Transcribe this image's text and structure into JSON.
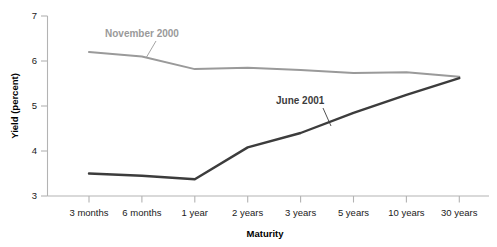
{
  "chart_data": {
    "type": "line",
    "title": "",
    "xlabel": "Maturity",
    "ylabel": "Yield (percent)",
    "categories": [
      "3 months",
      "6 months",
      "1 year",
      "2 years",
      "3 years",
      "5 years",
      "10 years",
      "30 years"
    ],
    "ylim": [
      3,
      7
    ],
    "yticks": [
      3,
      4,
      5,
      6,
      7
    ],
    "ytick_labels": [
      "3",
      "4",
      "5",
      "6",
      "7"
    ],
    "grid": false,
    "legend": "inline-annotations",
    "series": [
      {
        "name": "November 2000",
        "color": "#9a9a9a",
        "width": 2.0,
        "values": [
          6.2,
          6.1,
          5.82,
          5.85,
          5.8,
          5.73,
          5.75,
          5.65
        ],
        "annotation": {
          "label": "November 2000",
          "text_x": 105,
          "text_y": 37,
          "leader_x1": 156,
          "leader_y1": 41,
          "leader_x2": 146,
          "leader_y2": 58
        }
      },
      {
        "name": "June 2001",
        "color": "#3c3c3c",
        "width": 2.4,
        "values": [
          3.5,
          3.45,
          3.37,
          4.08,
          4.4,
          4.85,
          5.25,
          5.62
        ],
        "annotation": {
          "label": "June 2001",
          "text_x": 276,
          "text_y": 104,
          "leader_x1": 323,
          "leader_y1": 108,
          "leader_x2": 331,
          "leader_y2": 126
        }
      }
    ],
    "axis_colors": {
      "axis": "#b3b3b3",
      "tick_text": "#1a1a1a",
      "title": "#000000"
    }
  }
}
